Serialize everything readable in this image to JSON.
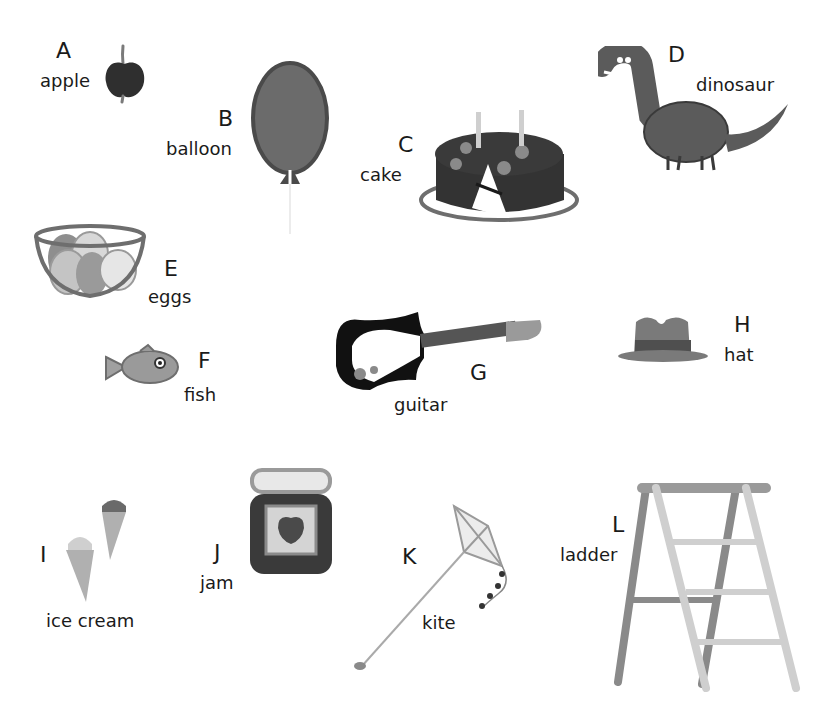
{
  "items": [
    {
      "letter": "A",
      "word": "apple"
    },
    {
      "letter": "B",
      "word": "balloon"
    },
    {
      "letter": "C",
      "word": "cake"
    },
    {
      "letter": "D",
      "word": "dinosaur"
    },
    {
      "letter": "E",
      "word": "eggs"
    },
    {
      "letter": "F",
      "word": "fish"
    },
    {
      "letter": "G",
      "word": "guitar"
    },
    {
      "letter": "H",
      "word": "hat"
    },
    {
      "letter": "I",
      "word": "ice cream"
    },
    {
      "letter": "J",
      "word": "jam"
    },
    {
      "letter": "K",
      "word": "kite"
    },
    {
      "letter": "L",
      "word": "ladder"
    }
  ],
  "colors": {
    "dark": "#3a3a3a",
    "mid": "#6e6e6e",
    "light": "#b5b5b5",
    "lighter": "#d6d6d6",
    "ink": "#1a1a1a"
  }
}
